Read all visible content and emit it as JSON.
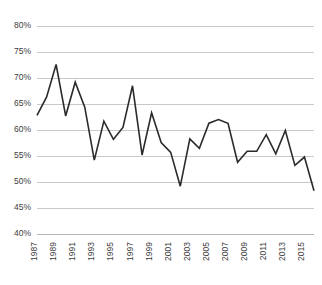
{
  "chart_data": {
    "type": "line",
    "title": "",
    "subtitle": "",
    "xlabel": "",
    "ylabel": "",
    "grid": "horizontal",
    "legend": "none",
    "ylim": [
      40,
      80
    ],
    "ytick_values": [
      80,
      75,
      70,
      65,
      60,
      55,
      50,
      45,
      40
    ],
    "ytick_labels": [
      "80%",
      "75%",
      "70%",
      "65%",
      "60%",
      "55%",
      "50%",
      "45%",
      "40%"
    ],
    "xlim": [
      1987,
      2016
    ],
    "xtick_values": [
      1987,
      1989,
      1991,
      1993,
      1995,
      1997,
      1999,
      2001,
      2003,
      2005,
      2007,
      2009,
      2011,
      2013,
      2015
    ],
    "xtick_labels": [
      "1987",
      "1989",
      "1991",
      "1993",
      "1995",
      "1997",
      "1999",
      "2001",
      "2003",
      "2005",
      "2007",
      "2009",
      "2011",
      "2013",
      "2015"
    ],
    "x": [
      1987,
      1988,
      1989,
      1990,
      1991,
      1992,
      1993,
      1994,
      1995,
      1996,
      1997,
      1998,
      1999,
      2000,
      2001,
      2002,
      2003,
      2004,
      2005,
      2006,
      2007,
      2008,
      2009,
      2010,
      2011,
      2012,
      2013,
      2014,
      2015,
      2016
    ],
    "values": [
      62.8,
      66.3,
      72.6,
      62.7,
      69.2,
      64.4,
      54.2,
      61.7,
      58.2,
      60.5,
      68.5,
      55.2,
      63.3,
      57.6,
      55.7,
      49.2,
      58.3,
      56.5,
      61.3,
      62.0,
      61.3,
      53.8,
      55.9,
      55.9,
      59.1,
      55.4,
      59.9,
      53.2,
      54.8,
      48.3
    ],
    "series_name": "",
    "line_color": "#2b2b2b",
    "grid_color": "#c9c9c9",
    "axis_color": "#b5b5b5",
    "background_color": "#ffffff",
    "tick_label_color": "#3d3d3d"
  }
}
